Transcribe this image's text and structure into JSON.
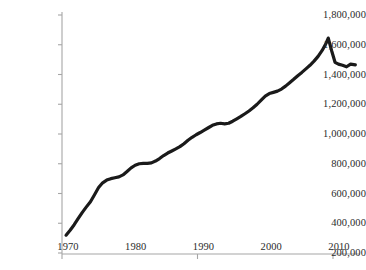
{
  "chart_data": {
    "type": "line",
    "title": "",
    "subtitle": "",
    "xlabel": "",
    "ylabel": "",
    "xlim": [
      1970.6,
      2013.4
    ],
    "ylim": [
      200000,
      1800000
    ],
    "grid": false,
    "legend": null,
    "annotations": [],
    "y_ticks": [
      {
        "value": 1800000,
        "label": "1,800,000"
      },
      {
        "value": 1600000,
        "label": "1,600,000"
      },
      {
        "value": 1400000,
        "label": "1,400,000"
      },
      {
        "value": 1200000,
        "label": "1,200,000"
      },
      {
        "value": 1000000,
        "label": "1,000,000"
      },
      {
        "value": 800000,
        "label": "800,000"
      },
      {
        "value": 600000,
        "label": "600,000"
      },
      {
        "value": 400000,
        "label": "400,000"
      },
      {
        "value": 200000,
        "label": "200,000"
      }
    ],
    "x_ticks": [
      {
        "value": 1970,
        "label": "1970"
      },
      {
        "value": 1980,
        "label": "1980"
      },
      {
        "value": 1990,
        "label": "1990"
      },
      {
        "value": 2000,
        "label": "2000"
      },
      {
        "value": 2010,
        "label": "2010"
      }
    ],
    "series": [
      {
        "name": "series-1",
        "color": "#1a1a1a",
        "x": [
          1970.6,
          1971.2,
          1971.8,
          1972.4,
          1973.0,
          1973.6,
          1974.2,
          1974.8,
          1975.4,
          1976.0,
          1976.6,
          1977.2,
          1977.8,
          1978.4,
          1979.0,
          1979.6,
          1980.2,
          1980.8,
          1981.4,
          1982.0,
          1982.6,
          1983.2,
          1983.8,
          1984.4,
          1985.0,
          1985.6,
          1986.2,
          1986.8,
          1987.4,
          1988.0,
          1988.6,
          1989.2,
          1989.8,
          1990.4,
          1991.0,
          1991.6,
          1992.2,
          1992.8,
          1993.4,
          1994.0,
          1994.6,
          1995.2,
          1995.8,
          1996.4,
          1997.0,
          1997.6,
          1998.2,
          1998.8,
          1999.4,
          2000.0,
          2000.6,
          2001.2,
          2001.8,
          2002.4,
          2003.0,
          2003.6,
          2004.2,
          2004.8,
          2005.4,
          2006.0,
          2006.6,
          2007.2,
          2007.8,
          2008.4,
          2009.0,
          2009.3,
          2009.8,
          2010.3,
          2010.8,
          2011.4,
          2012.0,
          2012.6,
          2013.3
        ],
        "y": [
          320000,
          353000,
          390000,
          432000,
          473000,
          510000,
          545000,
          592000,
          640000,
          672000,
          690000,
          700000,
          706000,
          712000,
          725000,
          748000,
          772000,
          790000,
          800000,
          803000,
          802000,
          806000,
          818000,
          835000,
          855000,
          872000,
          886000,
          900000,
          915000,
          935000,
          958000,
          978000,
          995000,
          1010000,
          1026000,
          1042000,
          1058000,
          1068000,
          1072000,
          1068000,
          1072000,
          1086000,
          1102000,
          1118000,
          1136000,
          1155000,
          1176000,
          1200000,
          1228000,
          1255000,
          1272000,
          1280000,
          1288000,
          1302000,
          1322000,
          1345000,
          1368000,
          1392000,
          1414000,
          1438000,
          1462000,
          1490000,
          1522000,
          1562000,
          1612000,
          1645000,
          1560000,
          1482000,
          1470000,
          1462000,
          1452000,
          1470000,
          1465000
        ]
      }
    ],
    "axes": {
      "axis_color": "#a6a6a6",
      "tick_color": "#a6a6a6",
      "line_color": "#1a1a1a",
      "line_width": 3.2
    }
  }
}
